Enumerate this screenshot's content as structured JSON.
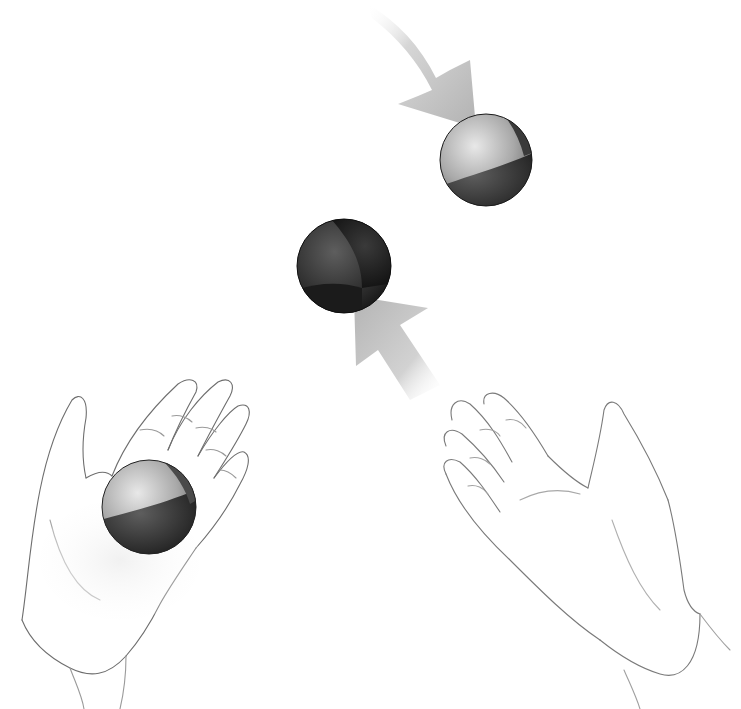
{
  "illustration": {
    "subject": "Juggling illustration: two open hands, three balls, two motion arrows",
    "background": "#ffffff",
    "balls": [
      {
        "name": "falling-ball",
        "cx": 486,
        "cy": 160,
        "r": 46,
        "light": "#c9c9c9",
        "dark": "#262626"
      },
      {
        "name": "rising-ball",
        "cx": 344,
        "cy": 266,
        "r": 47,
        "light": "#5a5a5a",
        "dark": "#1e1e1e"
      },
      {
        "name": "held-ball",
        "cx": 149,
        "cy": 507,
        "r": 47,
        "light": "#bdbdbd",
        "dark": "#2c2c2c"
      }
    ],
    "arrows": [
      {
        "name": "falling-arrow",
        "direction": "down-right",
        "color": "#b8b8b8"
      },
      {
        "name": "rising-arrow",
        "direction": "up-left",
        "color": "#b8b8b8"
      }
    ],
    "hands": [
      {
        "name": "left-hand",
        "holding": "held-ball"
      },
      {
        "name": "right-hand",
        "holding": "none"
      }
    ]
  }
}
